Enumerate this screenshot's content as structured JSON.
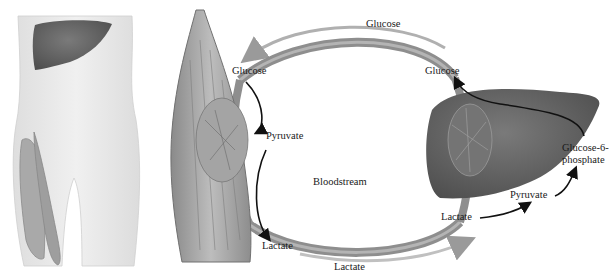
{
  "labels": {
    "glucose_top": "Glucose",
    "glucose_muscle": "Glucose",
    "pyruvate_muscle": "Pyruvate",
    "lactate_muscle": "Lactate",
    "bloodstream": "Bloodstream",
    "lactate_bottom": "Lactate",
    "glucose_liver": "Glucose",
    "lactate_liver": "Lactate",
    "pyruvate_liver": "Pyruvate",
    "g6p_line1": "Glucose-6-",
    "g6p_line2": "phosphate"
  },
  "figures": {
    "body_outline": "torso-with-liver-and-thigh-muscle",
    "muscle": "skeletal-muscle",
    "liver": "liver",
    "vessel": "blood-vessel-loop"
  },
  "colors": {
    "organ_dark": "#5e5e5e",
    "body_fill": "#ececec",
    "muscle_fill": "#9a9a9a",
    "vessel": "#8c8c8c",
    "flow_arrow": "#b5b5b5",
    "reaction_arrow": "#111111"
  }
}
